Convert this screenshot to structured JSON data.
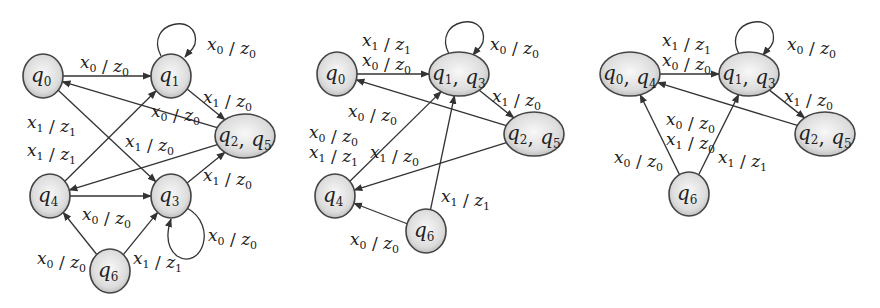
{
  "diagrams": [
    {
      "id": "automaton-1",
      "states": [
        {
          "id": "q0",
          "labels": [
            [
              "q",
              "0"
            ]
          ],
          "cx": 43,
          "cy": 76,
          "rx": 20,
          "ry": 22
        },
        {
          "id": "q1",
          "labels": [
            [
              "q",
              "1"
            ]
          ],
          "cx": 171,
          "cy": 76,
          "rx": 20,
          "ry": 22
        },
        {
          "id": "q2q5",
          "labels": [
            [
              "q",
              "2"
            ],
            [
              "q",
              "5"
            ]
          ],
          "cx": 245,
          "cy": 136,
          "rx": 30,
          "ry": 22
        },
        {
          "id": "q4",
          "labels": [
            [
              "q",
              "4"
            ]
          ],
          "cx": 50,
          "cy": 196,
          "rx": 20,
          "ry": 22
        },
        {
          "id": "q3",
          "labels": [
            [
              "q",
              "3"
            ]
          ],
          "cx": 171,
          "cy": 196,
          "rx": 20,
          "ry": 22
        },
        {
          "id": "q6",
          "labels": [
            [
              "q",
              "6"
            ]
          ],
          "cx": 110,
          "cy": 271,
          "rx": 20,
          "ry": 22
        }
      ],
      "edges": [
        {
          "from": "q0",
          "to": "q1",
          "label": [
            [
              "x",
              "0"
            ],
            [
              "z",
              "0"
            ]
          ],
          "lx": 80,
          "ly": 68
        },
        {
          "from": "q1",
          "to": "q1",
          "loop": true,
          "label": [
            [
              "x",
              "0"
            ],
            [
              "z",
              "0"
            ]
          ],
          "lx": 207,
          "ly": 50
        },
        {
          "from": "q1",
          "to": "q2q5",
          "label": [
            [
              "x",
              "1"
            ],
            [
              "z",
              "0"
            ]
          ],
          "lx": 203,
          "ly": 103
        },
        {
          "from": "q2q5",
          "to": "q0",
          "label": [
            [
              "x",
              "0"
            ],
            [
              "z",
              "0"
            ]
          ],
          "lx": 151,
          "ly": 117
        },
        {
          "from": "q0",
          "to": "q3",
          "label": [
            [
              "x",
              "1"
            ],
            [
              "z",
              "1"
            ]
          ],
          "lx": 27,
          "ly": 128
        },
        {
          "from": "q4",
          "to": "q1",
          "label": [
            [
              "x",
              "1"
            ],
            [
              "z",
              "1"
            ]
          ],
          "lx": 27,
          "ly": 156
        },
        {
          "from": "q2q5",
          "to": "q4",
          "label": [
            [
              "x",
              "1"
            ],
            [
              "z",
              "0"
            ]
          ],
          "lx": 125,
          "ly": 147
        },
        {
          "from": "q3",
          "to": "q2q5",
          "label": [
            [
              "x",
              "1"
            ],
            [
              "z",
              "0"
            ]
          ],
          "lx": 203,
          "ly": 181
        },
        {
          "from": "q4",
          "to": "q3",
          "label": [
            [
              "x",
              "0"
            ],
            [
              "z",
              "0"
            ]
          ],
          "lx": 82,
          "ly": 220
        },
        {
          "from": "q3",
          "to": "q3",
          "loop": true,
          "loopDir": "below",
          "label": [
            [
              "x",
              "0"
            ],
            [
              "z",
              "0"
            ]
          ],
          "lx": 208,
          "ly": 241
        },
        {
          "from": "q6",
          "to": "q4",
          "label": [
            [
              "x",
              "0"
            ],
            [
              "z",
              "0"
            ]
          ],
          "lx": 37,
          "ly": 264
        },
        {
          "from": "q6",
          "to": "q3",
          "label": [
            [
              "x",
              "1"
            ],
            [
              "z",
              "1"
            ]
          ],
          "lx": 133,
          "ly": 264
        }
      ]
    },
    {
      "id": "automaton-2",
      "states": [
        {
          "id": "q0",
          "labels": [
            [
              "q",
              "0"
            ]
          ],
          "cx": 337,
          "cy": 74,
          "rx": 20,
          "ry": 22
        },
        {
          "id": "q1q3",
          "labels": [
            [
              "q",
              "1"
            ],
            [
              "q",
              "3"
            ]
          ],
          "cx": 459,
          "cy": 74,
          "rx": 30,
          "ry": 22
        },
        {
          "id": "q2q5",
          "labels": [
            [
              "q",
              "2"
            ],
            [
              "q",
              "5"
            ]
          ],
          "cx": 534,
          "cy": 134,
          "rx": 30,
          "ry": 22
        },
        {
          "id": "q4",
          "labels": [
            [
              "q",
              "4"
            ]
          ],
          "cx": 335,
          "cy": 196,
          "rx": 20,
          "ry": 22
        },
        {
          "id": "q6",
          "labels": [
            [
              "q",
              "6"
            ]
          ],
          "cx": 426,
          "cy": 231,
          "rx": 20,
          "ry": 22
        }
      ],
      "edges": [
        {
          "from": "q0",
          "to": "q1q3",
          "label": [
            [
              "x",
              "1"
            ],
            [
              "z",
              "1"
            ]
          ],
          "lx": 362,
          "ly": 46,
          "label2": [
            [
              "x",
              "0"
            ],
            [
              "z",
              "0"
            ]
          ],
          "lx2": 362,
          "ly2": 66
        },
        {
          "from": "q1q3",
          "to": "q1q3",
          "loop": true,
          "label": [
            [
              "x",
              "0"
            ],
            [
              "z",
              "0"
            ]
          ],
          "lx": 490,
          "ly": 50
        },
        {
          "from": "q1q3",
          "to": "q2q5",
          "label": [
            [
              "x",
              "1"
            ],
            [
              "z",
              "0"
            ]
          ],
          "lx": 492,
          "ly": 102
        },
        {
          "from": "q2q5",
          "to": "q0",
          "label": [
            [
              "x",
              "0"
            ],
            [
              "z",
              "0"
            ]
          ],
          "lx": 348,
          "ly": 117
        },
        {
          "from": "q4",
          "to": "q1q3",
          "label": [
            [
              "x",
              "0"
            ],
            [
              "z",
              "0"
            ]
          ],
          "lx": 309,
          "ly": 138,
          "label2": [
            [
              "x",
              "1"
            ],
            [
              "z",
              "1"
            ]
          ],
          "lx2": 309,
          "ly2": 158
        },
        {
          "from": "q2q5",
          "to": "q4",
          "label": [
            [
              "x",
              "1"
            ],
            [
              "z",
              "0"
            ]
          ],
          "lx": 370,
          "ly": 158
        },
        {
          "from": "q6",
          "to": "q1q3",
          "label": [
            [
              "x",
              "1"
            ],
            [
              "z",
              "1"
            ]
          ],
          "lx": 441,
          "ly": 202
        },
        {
          "from": "q6",
          "to": "q4",
          "label": [
            [
              "x",
              "0"
            ],
            [
              "z",
              "0"
            ]
          ],
          "lx": 350,
          "ly": 245
        }
      ]
    },
    {
      "id": "automaton-3",
      "states": [
        {
          "id": "q0q4",
          "labels": [
            [
              "q",
              "0"
            ],
            [
              "q",
              "4"
            ]
          ],
          "cx": 630,
          "cy": 74,
          "rx": 30,
          "ry": 22
        },
        {
          "id": "q1q3",
          "labels": [
            [
              "q",
              "1"
            ],
            [
              "q",
              "3"
            ]
          ],
          "cx": 749,
          "cy": 74,
          "rx": 30,
          "ry": 22
        },
        {
          "id": "q2q5",
          "labels": [
            [
              "q",
              "2"
            ],
            [
              "q",
              "5"
            ]
          ],
          "cx": 825,
          "cy": 134,
          "rx": 30,
          "ry": 22
        },
        {
          "id": "q6",
          "labels": [
            [
              "q",
              "6"
            ]
          ],
          "cx": 689,
          "cy": 194,
          "rx": 20,
          "ry": 22
        }
      ],
      "edges": [
        {
          "from": "q0q4",
          "to": "q1q3",
          "label": [
            [
              "x",
              "1"
            ],
            [
              "z",
              "1"
            ]
          ],
          "lx": 662,
          "ly": 46,
          "label2": [
            [
              "x",
              "0"
            ],
            [
              "z",
              "0"
            ]
          ],
          "lx2": 662,
          "ly2": 66
        },
        {
          "from": "q1q3",
          "to": "q1q3",
          "loop": true,
          "label": [
            [
              "x",
              "0"
            ],
            [
              "z",
              "0"
            ]
          ],
          "lx": 787,
          "ly": 50
        },
        {
          "from": "q1q3",
          "to": "q2q5",
          "label": [
            [
              "x",
              "1"
            ],
            [
              "z",
              "0"
            ]
          ],
          "lx": 784,
          "ly": 102
        },
        {
          "from": "q2q5",
          "to": "q0q4",
          "label": [
            [
              "x",
              "0"
            ],
            [
              "z",
              "0"
            ]
          ],
          "lx": 666,
          "ly": 125,
          "label2": [
            [
              "x",
              "1"
            ],
            [
              "z",
              "0"
            ]
          ],
          "lx2": 666,
          "ly2": 145
        },
        {
          "from": "q6",
          "to": "q0q4",
          "label": [
            [
              "x",
              "0"
            ],
            [
              "z",
              "0"
            ]
          ],
          "lx": 614,
          "ly": 163
        },
        {
          "from": "q6",
          "to": "q1q3",
          "label": [
            [
              "x",
              "1"
            ],
            [
              "z",
              "1"
            ]
          ],
          "lx": 718,
          "ly": 163
        }
      ]
    }
  ],
  "colors": {
    "node_fill_center": "#f7f7f7",
    "node_fill_edge": "#bdbdbd",
    "stroke": "#333333",
    "text": "#222222"
  }
}
